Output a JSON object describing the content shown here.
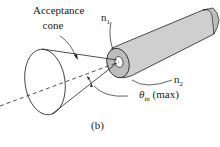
{
  "diagram": {
    "title_label_line1": "Acceptance",
    "title_label_line2": "cone",
    "n1_label": "n",
    "n1_sub": "1",
    "n2_label": "n",
    "n2_sub": "2",
    "theta_label": "θ",
    "theta_sub": "in",
    "theta_suffix": " (max)",
    "caption": "(b)",
    "colors": {
      "line": "#222222",
      "cladding_fill": "#cfcfcf",
      "cladding_face": "#bdbdbd",
      "core_fill": "#ffffff"
    }
  }
}
